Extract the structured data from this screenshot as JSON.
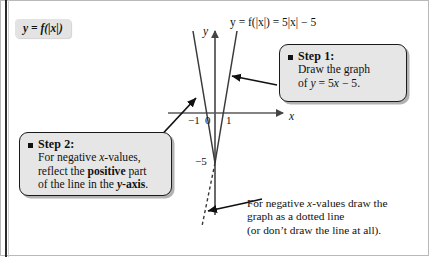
{
  "title_chip": {
    "text": "y = f(|x|)"
  },
  "graph": {
    "equation_label": "y = f(|x|) = 5|x| − 5",
    "axis_x_label": "x",
    "axis_y_label": "y",
    "ticks": {
      "x_neg1": "−1",
      "x_zero": "0",
      "x_one": "1",
      "y_neg5": "−5"
    },
    "vertex": {
      "x": 0,
      "y": -5
    },
    "function": "y = 5|x| - 5",
    "solid_branches": [
      {
        "name": "right-branch",
        "from": [
          0,
          -5
        ],
        "to": [
          1.45,
          2.25
        ]
      },
      {
        "name": "left-branch",
        "from": [
          0,
          -5
        ],
        "to": [
          -1.45,
          2.25
        ]
      }
    ],
    "dotted_branch": {
      "name": "negative-part-of-line",
      "from": [
        0,
        -5
      ],
      "to": [
        -0.85,
        -9.25
      ]
    },
    "line_color": "#333333",
    "axis_color": "#555555"
  },
  "step1": {
    "bullet": "square-bullet",
    "title": "Step 1:",
    "lines": [
      "Draw the graph",
      "of y = 5x − 5."
    ],
    "line1": "Draw the graph",
    "line2_prefix": "of ",
    "line2_var": "y",
    "line2_mid": " = 5",
    "line2_var2": "x",
    "line2_suffix": " − 5."
  },
  "step2": {
    "bullet": "square-bullet",
    "title": "Step 2:",
    "lines": [
      "For negative x-values,",
      "reflect the positive part",
      "of the line in the y-axis."
    ],
    "l1_a": "For negative ",
    "l1_var": "x",
    "l1_b": "-values,",
    "l2_a": "reflect the ",
    "l2_bold": "positive",
    "l2_b": " part",
    "l3_a": "of the line in the ",
    "l3_bold_var": "y",
    "l3_bold_rest": "-axis",
    "l3_b": "."
  },
  "footnote": {
    "l1_a": "For negative ",
    "l1_var": "x",
    "l1_b": "-values draw the",
    "line2": "graph as a dotted line",
    "line3": "(or don’t draw the line at all)."
  },
  "colors": {
    "chip_bg": "#e3e3e3",
    "callout_bg": "#e6e6e6",
    "callout_border": "#1a1a1a",
    "ink": "#111111",
    "axis": "#555555",
    "curve": "#333333",
    "page_bg": "#ffffff",
    "spine": "#2b2b2b"
  }
}
